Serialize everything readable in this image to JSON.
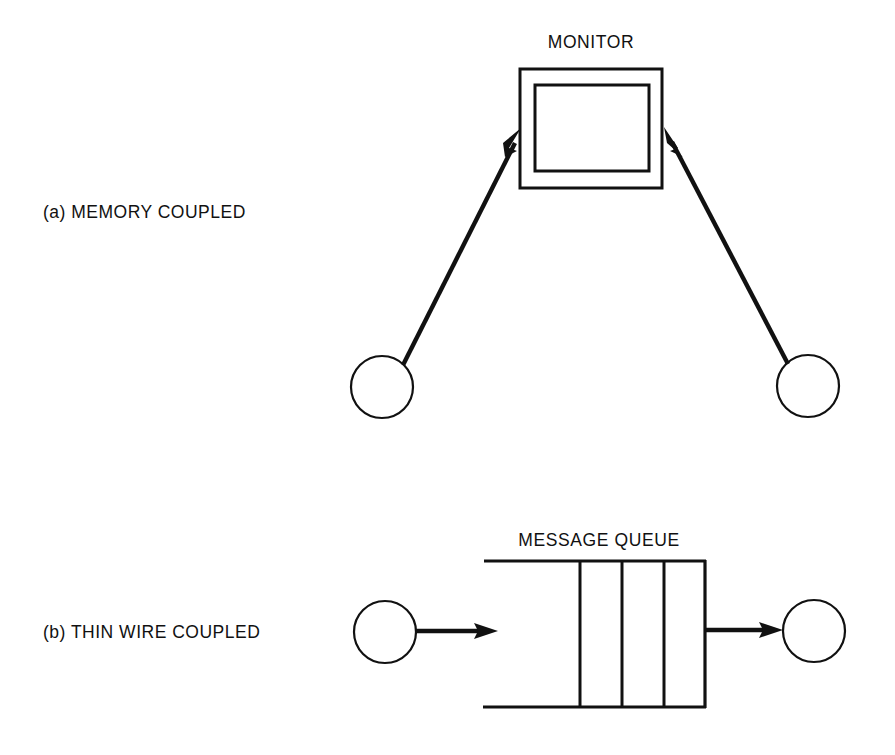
{
  "figure": {
    "background_color": "#ffffff",
    "ink_color": "#111111",
    "parts": [
      {
        "id": "a",
        "label": "(a)  MEMORY COUPLED",
        "label_prefix": "(a)",
        "label_text": "MEMORY COUPLED",
        "center_element_label": "MONITOR",
        "node_count": 2,
        "arrow_direction": "nodes-to-monitor"
      },
      {
        "id": "b",
        "label": "(b)  THIN WIRE COUPLED",
        "label_prefix": "(b)",
        "label_text": "THIN WIRE COUPLED",
        "center_element_label": "MESSAGE QUEUE",
        "node_count": 2,
        "queue_slot_count": 3,
        "arrow_direction": "left-node-to-queue-to-right-node"
      }
    ]
  },
  "part_a": {
    "caption": "(a)  MEMORY COUPLED",
    "monitor_title": "MONITOR",
    "monitor": {
      "outer": {
        "x": 520,
        "y": 69,
        "width": 142,
        "height": 119
      },
      "inner": {
        "x": 535,
        "y": 85,
        "width": 114,
        "height": 86
      }
    },
    "left_node": {
      "cx": 382,
      "cy": 387,
      "r": 31
    },
    "right_node": {
      "cx": 808,
      "cy": 386,
      "r": 31
    },
    "left_arrow": {
      "x1": 404,
      "y1": 364,
      "x2": 523,
      "y2": 128
    },
    "right_arrow": {
      "x1": 787,
      "y1": 363,
      "x2": 664,
      "y2": 127
    }
  },
  "part_b": {
    "caption": "(b)  THIN WIRE COUPLED",
    "queue_title": "MESSAGE QUEUE",
    "queue": {
      "left": 484,
      "right": 705,
      "top": 561,
      "bottom": 707,
      "dividers": [
        580,
        622,
        664
      ]
    },
    "left_node": {
      "cx": 385,
      "cy": 632,
      "r": 31
    },
    "right_node": {
      "cx": 814,
      "cy": 631,
      "r": 31
    },
    "in_arrow": {
      "x1": 417,
      "y1": 631,
      "x2": 498,
      "y2": 631
    },
    "out_arrow": {
      "x1": 706,
      "y1": 630,
      "x2": 782,
      "y2": 630
    }
  },
  "text_positions": {
    "caption_a": {
      "x": 43,
      "y": 218
    },
    "caption_b": {
      "x": 43,
      "y": 638
    },
    "monitor_title": {
      "x": 591,
      "y": 48
    },
    "queue_title": {
      "x": 599,
      "y": 546
    }
  }
}
